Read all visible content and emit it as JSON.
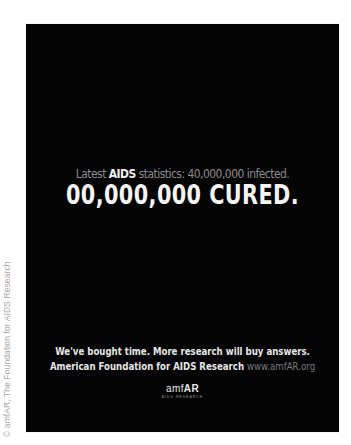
{
  "credit": "© amfAR, The Foundation for AIDS Research",
  "ad": {
    "headline": {
      "prefix": "Latest ",
      "bold": "AIDS",
      "suffix": " statistics: 40,000,000 infected."
    },
    "main": "00,000,000 CURED.",
    "tagline1": "We've bought time. More research will buy answers.",
    "tagline2": "American Foundation for AIDS Research ",
    "url": "www.amfAR.org",
    "logo": {
      "light": "amf",
      "bold": "AR",
      "sub": "AIDS RESEARCH"
    }
  }
}
